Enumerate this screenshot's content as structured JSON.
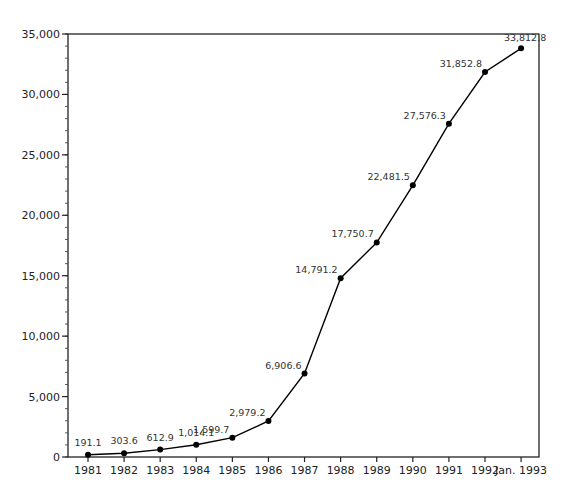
{
  "chart_data": {
    "type": "line",
    "title": "",
    "xlabel": "",
    "ylabel": "",
    "categories": [
      "1981",
      "1982",
      "1983",
      "1984",
      "1985",
      "1986",
      "1987",
      "1988",
      "1989",
      "1990",
      "1991",
      "1992",
      "Jan. 1993"
    ],
    "series": [
      {
        "name": "Series 1",
        "values": [
          191.1,
          303.6,
          612.9,
          1014.1,
          1599.7,
          2979.2,
          6906.6,
          14791.2,
          17750.7,
          22481.5,
          27576.3,
          31852.8,
          33812.8
        ],
        "labels": [
          "191.1",
          "303.6",
          "612.9",
          "1,014.1",
          "1,599.7",
          "2,979.2",
          "6,906.6",
          "14,791.2",
          "17,750.7",
          "22,481.5",
          "27,576.3",
          "31,852.8",
          "33,812.8"
        ]
      }
    ],
    "ylim": [
      0,
      35000
    ],
    "yticks": [
      0,
      5000,
      10000,
      15000,
      20000,
      25000,
      30000,
      35000
    ],
    "ytick_labels": [
      "0",
      "5,000",
      "10,000",
      "15,000",
      "20,000",
      "25,000",
      "30,000",
      "35,000"
    ],
    "minor_ytick_step": 1000,
    "grid": false,
    "legend": "none",
    "frame": "box",
    "markers": "filled-circle",
    "line_color": "#000000"
  }
}
